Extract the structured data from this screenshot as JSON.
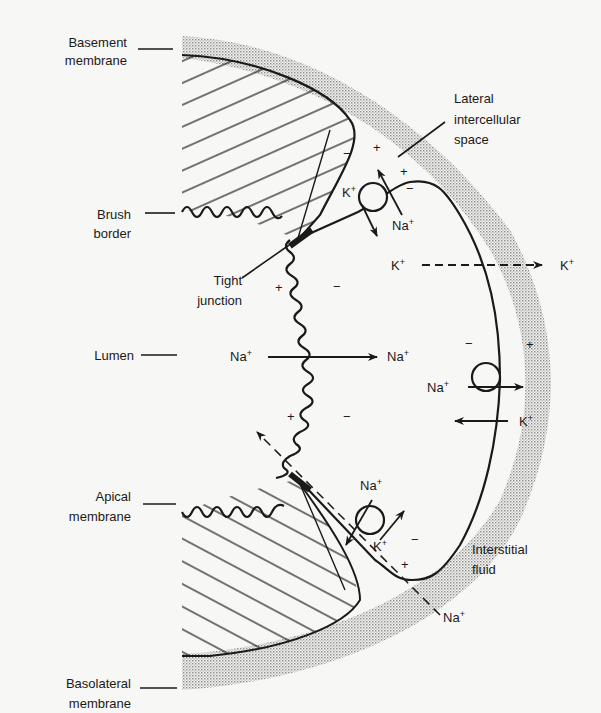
{
  "diagram": {
    "labels": {
      "basement_membrane": [
        "Basement",
        "membrane"
      ],
      "lateral_space": [
        "Lateral",
        "intercellular",
        "space"
      ],
      "brush_border": [
        "Brush",
        "border"
      ],
      "tight_junction": [
        "Tight",
        "junction"
      ],
      "lumen": "Lumen",
      "apical_membrane": [
        "Apical",
        "membrane"
      ],
      "interstitial_fluid": [
        "Interstitial",
        "fluid"
      ],
      "basolateral_membrane": [
        "Basolateral",
        "membrane"
      ]
    },
    "ions": {
      "na": "Na",
      "k": "K",
      "charge": "+"
    },
    "signs": {
      "plus": "+",
      "minus": "−"
    },
    "colors": {
      "ink": "#1a1a1a",
      "background": "#f7f7f5",
      "stipple": "#9a9a9a"
    }
  }
}
